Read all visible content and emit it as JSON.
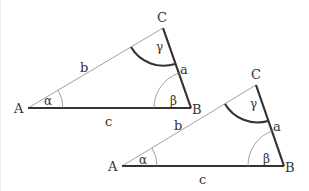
{
  "diagram": {
    "triangles": [
      {
        "vertices": {
          "A": "A",
          "B": "B",
          "C": "C"
        },
        "sides": {
          "a": "a",
          "b": "b",
          "c": "c"
        },
        "angles": {
          "alpha": "α",
          "beta": "β",
          "gamma": "γ"
        }
      },
      {
        "vertices": {
          "A": "A",
          "B": "B",
          "C": "C"
        },
        "sides": {
          "a": "a",
          "b": "b",
          "c": "c"
        },
        "angles": {
          "alpha": "α",
          "beta": "β",
          "gamma": "γ"
        }
      }
    ],
    "colors": {
      "thick_line": "#333333",
      "thin_line": "#8a8a8a",
      "background": "#ffffff"
    }
  }
}
